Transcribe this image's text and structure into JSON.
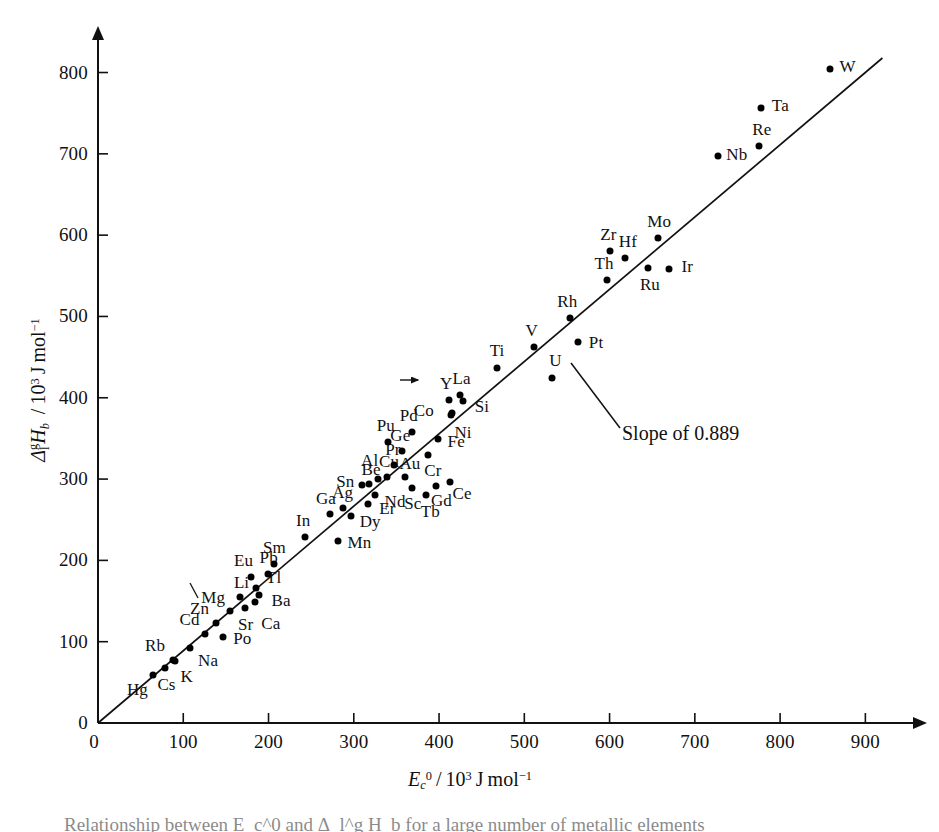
{
  "figure": {
    "caption": "Relationship between E_c^0 and Δ_l^g H_b for a large number of metallic elements"
  },
  "axes": {
    "x_title_html": "E_c^0 / 10^3 J mol^-1",
    "y_title_html": "Δ_l^g H_b / 10^3 J mol^-1",
    "x_ticks": [
      "0",
      "100",
      "200",
      "300",
      "400",
      "500",
      "600",
      "700",
      "800",
      "900"
    ],
    "y_ticks": [
      "0",
      "100",
      "200",
      "300",
      "400",
      "500",
      "600",
      "700",
      "800"
    ]
  },
  "annotation": {
    "slope_label": "Slope of 0.889"
  },
  "chart_data": {
    "type": "scatter",
    "title": "",
    "xlabel": "E_c^0 / 10^3 J mol^-1",
    "ylabel": "Delta_l^g H_b / 10^3 J mol^-1",
    "xlim": [
      0,
      950
    ],
    "ylim": [
      0,
      840
    ],
    "grid": false,
    "legend": "none",
    "fit_line": {
      "label": "Slope of 0.889",
      "slope": 0.889,
      "intercept": 0,
      "x_from": 0,
      "x_to": 920
    },
    "point_label_field": "element",
    "points": [
      {
        "element": "Hg",
        "x": 65,
        "y": 59,
        "lx": -16,
        "ly": 15
      },
      {
        "element": "Cs",
        "x": 78,
        "y": 68,
        "lx": 2,
        "ly": 17
      },
      {
        "element": "Rb",
        "x": 88,
        "y": 77,
        "lx": -18,
        "ly": -14
      },
      {
        "element": "K",
        "x": 90,
        "y": 76,
        "lx": 12,
        "ly": 16
      },
      {
        "element": "Na",
        "x": 108,
        "y": 92,
        "lx": 18,
        "ly": 13
      },
      {
        "element": "Cd",
        "x": 125,
        "y": 110,
        "lx": -15,
        "ly": -14
      },
      {
        "element": "Zn",
        "x": 138,
        "y": 123,
        "lx": -16,
        "ly": -14
      },
      {
        "element": "Po",
        "x": 147,
        "y": 106,
        "lx": 19,
        "ly": 2
      },
      {
        "element": "Mg",
        "x": 155,
        "y": 138,
        "lx": -17,
        "ly": -13
      },
      {
        "element": "Sr",
        "x": 172,
        "y": 142,
        "lx": 1,
        "ly": 17
      },
      {
        "element": "Li",
        "x": 166,
        "y": 155,
        "lx": 2,
        "ly": -14
      },
      {
        "element": "Ca",
        "x": 184,
        "y": 149,
        "lx": 16,
        "ly": 22
      },
      {
        "element": "Ba",
        "x": 189,
        "y": 157,
        "lx": 22,
        "ly": 6
      },
      {
        "element": "Tl",
        "x": 185,
        "y": 166,
        "lx": 18,
        "ly": -10
      },
      {
        "element": "Eu",
        "x": 180,
        "y": 179,
        "lx": -8,
        "ly": -16
      },
      {
        "element": "Pb",
        "x": 199,
        "y": 183,
        "lx": 1,
        "ly": -16
      },
      {
        "element": "Sm",
        "x": 207,
        "y": 196,
        "lx": 0,
        "ly": -16
      },
      {
        "element": "In",
        "x": 243,
        "y": 229,
        "lx": -2,
        "ly": -16
      },
      {
        "element": "Mn",
        "x": 282,
        "y": 224,
        "lx": 21,
        "ly": 2
      },
      {
        "element": "Ga",
        "x": 272,
        "y": 257,
        "lx": -4,
        "ly": -15
      },
      {
        "element": "Ag",
        "x": 287,
        "y": 265,
        "lx": 0,
        "ly": -15
      },
      {
        "element": "Dy",
        "x": 297,
        "y": 254,
        "lx": 19,
        "ly": 6
      },
      {
        "element": "Er",
        "x": 317,
        "y": 269,
        "lx": 19,
        "ly": 5
      },
      {
        "element": "Nd",
        "x": 325,
        "y": 281,
        "lx": 20,
        "ly": 7
      },
      {
        "element": "Sn",
        "x": 310,
        "y": 293,
        "lx": -17,
        "ly": -3
      },
      {
        "element": "Be",
        "x": 318,
        "y": 294,
        "lx": 2,
        "ly": -14
      },
      {
        "element": "Al",
        "x": 328,
        "y": 300,
        "lx": -8,
        "ly": -18
      },
      {
        "element": "Cu",
        "x": 339,
        "y": 303,
        "lx": 2,
        "ly": -15
      },
      {
        "element": "Pr",
        "x": 347,
        "y": 317,
        "lx": -1,
        "ly": -15
      },
      {
        "element": "Au",
        "x": 360,
        "y": 302,
        "lx": 5,
        "ly": -13
      },
      {
        "element": "Sc",
        "x": 368,
        "y": 289,
        "lx": 1,
        "ly": 16
      },
      {
        "element": "Tb",
        "x": 385,
        "y": 281,
        "lx": 4,
        "ly": 17
      },
      {
        "element": "Gd",
        "x": 397,
        "y": 292,
        "lx": 5,
        "ly": 15
      },
      {
        "element": "Ce",
        "x": 413,
        "y": 297,
        "lx": 12,
        "ly": 12
      },
      {
        "element": "Ge",
        "x": 357,
        "y": 334,
        "lx": -2,
        "ly": -15
      },
      {
        "element": "Pu",
        "x": 340,
        "y": 345,
        "lx": -2,
        "ly": -16
      },
      {
        "element": "Pd",
        "x": 368,
        "y": 358,
        "lx": -3,
        "ly": -16
      },
      {
        "element": "Cr",
        "x": 387,
        "y": 330,
        "lx": 5,
        "ly": 16
      },
      {
        "element": "Fe",
        "x": 399,
        "y": 349,
        "lx": 18,
        "ly": 3
      },
      {
        "element": "Ni",
        "x": 414,
        "y": 379,
        "lx": 12,
        "ly": 18
      },
      {
        "element": "Co",
        "x": 415,
        "y": 381,
        "lx": -28,
        "ly": -2
      },
      {
        "element": "Y",
        "x": 412,
        "y": 397,
        "lx": -3,
        "ly": -16
      },
      {
        "element": "La",
        "x": 424,
        "y": 404,
        "lx": 2,
        "ly": -16
      },
      {
        "element": "Si",
        "x": 428,
        "y": 396,
        "lx": 19,
        "ly": 6
      },
      {
        "element": "Ti",
        "x": 468,
        "y": 436,
        "lx": 0,
        "ly": -17
      },
      {
        "element": "U",
        "x": 533,
        "y": 424,
        "lx": 3,
        "ly": -17
      },
      {
        "element": "V",
        "x": 511,
        "y": 463,
        "lx": -2,
        "ly": -16
      },
      {
        "element": "Rh",
        "x": 554,
        "y": 498,
        "lx": -3,
        "ly": -16
      },
      {
        "element": "Pt",
        "x": 563,
        "y": 468,
        "lx": 18,
        "ly": 1
      },
      {
        "element": "Th",
        "x": 597,
        "y": 545,
        "lx": -3,
        "ly": -16
      },
      {
        "element": "Zr",
        "x": 601,
        "y": 580,
        "lx": -2,
        "ly": -16
      },
      {
        "element": "Hf",
        "x": 618,
        "y": 572,
        "lx": 3,
        "ly": -16
      },
      {
        "element": "Mo",
        "x": 657,
        "y": 597,
        "lx": 1,
        "ly": -16
      },
      {
        "element": "Ru",
        "x": 645,
        "y": 560,
        "lx": 2,
        "ly": 17
      },
      {
        "element": "Ir",
        "x": 670,
        "y": 558,
        "lx": 18,
        "ly": -2
      },
      {
        "element": "Nb",
        "x": 727,
        "y": 697,
        "lx": 19,
        "ly": -1
      },
      {
        "element": "Re",
        "x": 775,
        "y": 710,
        "lx": 3,
        "ly": -16
      },
      {
        "element": "Ta",
        "x": 778,
        "y": 756,
        "lx": 19,
        "ly": -2
      },
      {
        "element": "W",
        "x": 858,
        "y": 804,
        "lx": 18,
        "ly": -2
      }
    ]
  }
}
